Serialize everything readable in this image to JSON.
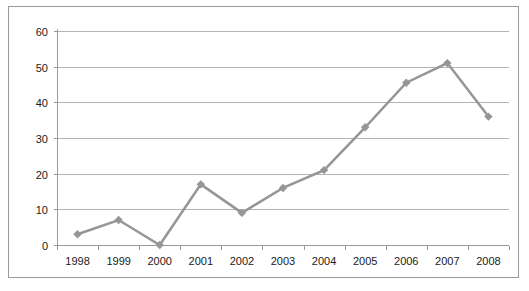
{
  "chart_data": {
    "type": "line",
    "title": "",
    "subtitle": "",
    "xlabel": "",
    "ylabel": "",
    "categories": [
      "1998",
      "1999",
      "2000",
      "2001",
      "2002",
      "2003",
      "2004",
      "2005",
      "2006",
      "2007",
      "2008"
    ],
    "series": [
      {
        "name": "",
        "values": [
          3,
          7,
          0,
          17,
          9,
          16,
          21,
          33,
          45.5,
          51,
          36
        ],
        "color": "#969696",
        "marker": "diamond",
        "line_width": 2.5
      }
    ],
    "ylim": [
      0,
      60
    ],
    "y_ticks": [
      0,
      10,
      20,
      30,
      40,
      50,
      60
    ],
    "y_tick_labels": [
      "0",
      "10",
      "20",
      "30",
      "40",
      "50",
      "60"
    ],
    "x_tick_labels": [
      "1998",
      "1999",
      "2000",
      "2001",
      "2002",
      "2003",
      "2004",
      "2005",
      "2006",
      "2007",
      "2008"
    ],
    "grid": {
      "horizontal": true,
      "vertical": false,
      "color": "#b4b4b4"
    },
    "legend": {
      "visible": false,
      "position": "none",
      "entries": []
    },
    "axis": {
      "x_axis_color": "#9a9a9a",
      "y_axis_color": "#9a9a9a",
      "tick_marks": true
    },
    "border": {
      "visible": true,
      "color": "#9a9a9a"
    },
    "plot_background": "#ffffff"
  },
  "figure": {
    "background": "#ffffff",
    "width": 529,
    "height": 291
  }
}
